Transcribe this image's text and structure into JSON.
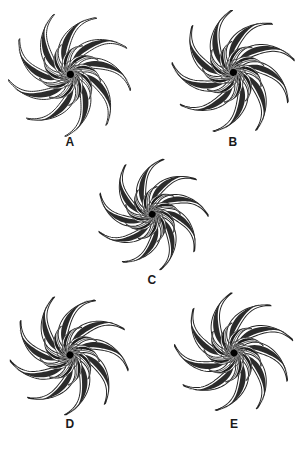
{
  "page": {
    "background_color": "#ffffff",
    "width": 302,
    "height": 452,
    "ink_color": "#1d1d1d",
    "label_color": "#1a1a1a"
  },
  "figures": [
    {
      "id": "A",
      "label": "A",
      "center_x": 70,
      "center_y": 74,
      "radius": 62,
      "rotation": 0,
      "label_x": 70,
      "label_y": 136,
      "petal_count": 9,
      "mid_petal_count": 9,
      "inner_petal_count": 12,
      "core_dot_radius": 3.6
    },
    {
      "id": "B",
      "label": "B",
      "center_x": 233,
      "center_y": 72,
      "radius": 62,
      "rotation": 14,
      "label_x": 233,
      "label_y": 136,
      "petal_count": 9,
      "mid_petal_count": 9,
      "inner_petal_count": 12,
      "core_dot_radius": 3.6
    },
    {
      "id": "C",
      "label": "C",
      "center_x": 152,
      "center_y": 214,
      "radius": 56,
      "rotation": 27,
      "label_x": 152,
      "label_y": 274,
      "petal_count": 9,
      "mid_petal_count": 9,
      "inner_petal_count": 12,
      "core_dot_radius": 3.4
    },
    {
      "id": "D",
      "label": "D",
      "center_x": 70,
      "center_y": 355,
      "radius": 60,
      "rotation": 40,
      "label_x": 70,
      "label_y": 418,
      "petal_count": 9,
      "mid_petal_count": 9,
      "inner_petal_count": 12,
      "core_dot_radius": 3.5
    },
    {
      "id": "E",
      "label": "E",
      "center_x": 234,
      "center_y": 353,
      "radius": 60,
      "rotation": 53,
      "label_x": 234,
      "label_y": 418,
      "petal_count": 9,
      "mid_petal_count": 9,
      "inner_petal_count": 12,
      "core_dot_radius": 3.5
    }
  ]
}
